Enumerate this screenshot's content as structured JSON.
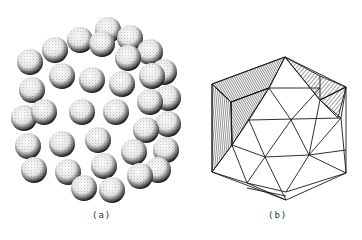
{
  "figure": {
    "panels": [
      {
        "id": "a",
        "caption": "(a)",
        "description": "close-packed cluster of stippled spheres"
      },
      {
        "id": "b",
        "caption": "(b)",
        "description": "triangulated polyhedron (icosahedral) line drawing with hatched faces"
      }
    ]
  },
  "colors": {
    "background": "#ffffff",
    "ink": "#1a1a1a"
  }
}
